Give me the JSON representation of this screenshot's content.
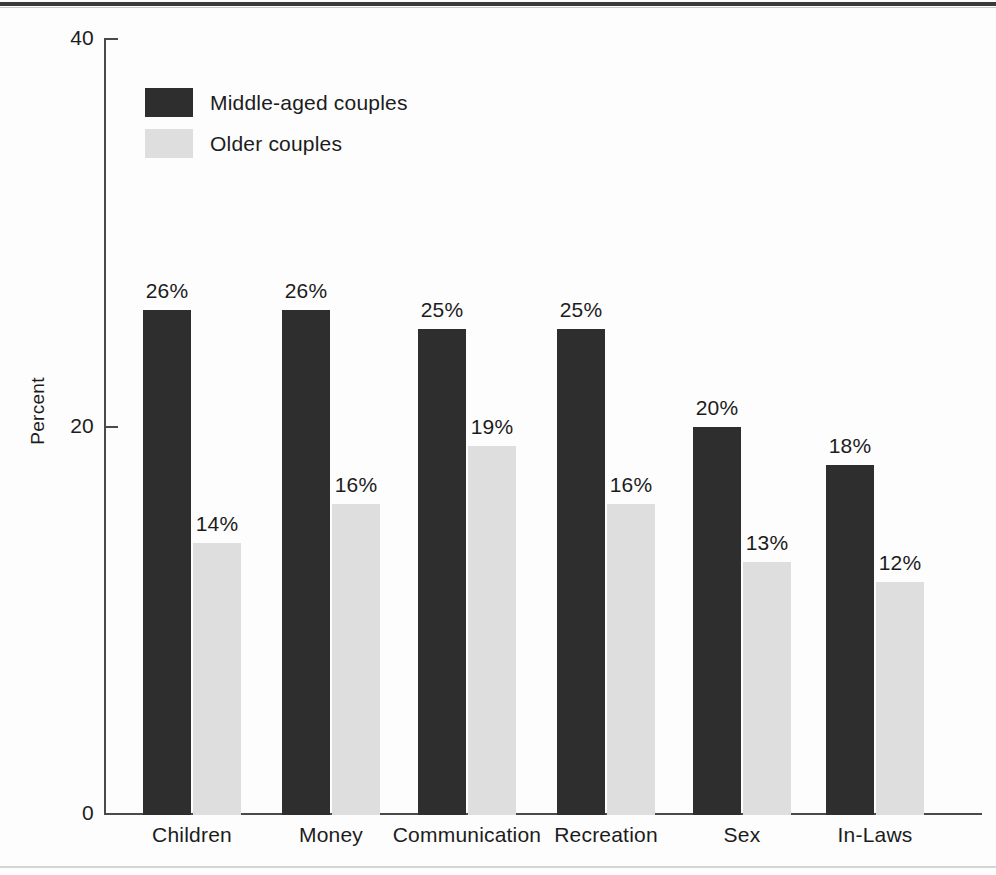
{
  "chart_data": {
    "type": "bar",
    "title": "",
    "xlabel": "",
    "ylabel": "Percent",
    "ylim": [
      0,
      40
    ],
    "yticks": [
      0,
      20,
      40
    ],
    "ytick_labels": [
      "0",
      "20",
      "40"
    ],
    "grid": false,
    "legend_position": "upper-left-inside",
    "value_label_suffix": "%",
    "categories": [
      "Children",
      "Money",
      "Communication",
      "Recreation",
      "Sex",
      "In-Laws"
    ],
    "series": [
      {
        "name": "Middle-aged couples",
        "color": "#2e2e2e",
        "values": [
          26,
          26,
          25,
          25,
          20,
          18
        ],
        "value_labels": [
          "26%",
          "26%",
          "25%",
          "25%",
          "20%",
          "18%"
        ]
      },
      {
        "name": "Older couples",
        "color": "#dedede",
        "values": [
          14,
          16,
          19,
          16,
          13,
          12
        ],
        "value_labels": [
          "14%",
          "16%",
          "19%",
          "16%",
          "13%",
          "12%"
        ]
      }
    ]
  },
  "axes": {
    "y_title": "Percent",
    "y_tick_40": "40",
    "y_tick_20": "20",
    "y_tick_0": "0"
  },
  "legend": {
    "items": [
      {
        "label": "Middle-aged couples",
        "color": "#2e2e2e"
      },
      {
        "label": "Older couples",
        "color": "#dedede"
      }
    ]
  },
  "colors": {
    "dark_series": "#2e2e2e",
    "light_series": "#dedede",
    "axis": "#4a4a4a",
    "text": "#1c1c1c",
    "rule": "#3a3a3a",
    "background": "#fdfdfd"
  }
}
